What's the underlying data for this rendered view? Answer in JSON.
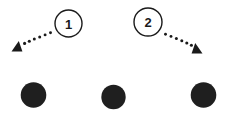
{
  "diagram": {
    "name": "two-step-motion-diagram",
    "background_color": "#ffffff",
    "stroke_color": "#1a1a1a",
    "fill_color": "#1f1f1f",
    "steps": [
      {
        "id": "step-1",
        "label": "1",
        "badge": {
          "shape": "circle-outline",
          "cx": 68.5,
          "cy": 23.5,
          "r": 13.5,
          "stroke_width": 1.4
        },
        "arrow": {
          "name": "dotted-arrow-left",
          "direction": "left-down",
          "style": "dotted",
          "from_x": 55,
          "from_y": 32,
          "to_x": 20,
          "to_y": 47,
          "dot_count": 7,
          "dot_radius": 1.5,
          "head_size": 9
        }
      },
      {
        "id": "step-2",
        "label": "2",
        "badge": {
          "shape": "circle-outline",
          "cx": 148,
          "cy": 22,
          "r": 14,
          "stroke_width": 1.4
        },
        "arrow": {
          "name": "dotted-arrow-right",
          "direction": "right-down",
          "style": "dotted",
          "from_x": 161,
          "from_y": 33,
          "to_x": 196,
          "to_y": 50,
          "dot_count": 7,
          "dot_radius": 1.5,
          "head_size": 9
        }
      }
    ],
    "nodes": [
      {
        "id": "node-left",
        "name": "filled-dot-left",
        "cx": 33.5,
        "cy": 95,
        "r": 12.8
      },
      {
        "id": "node-middle",
        "name": "filled-dot-middle",
        "cx": 113.5,
        "cy": 97,
        "r": 12.2
      },
      {
        "id": "node-right",
        "name": "filled-dot-right",
        "cx": 203.5,
        "cy": 95,
        "r": 12.8
      }
    ]
  }
}
